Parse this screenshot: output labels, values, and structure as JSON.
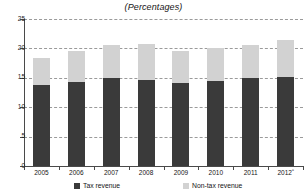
{
  "chart_data": {
    "type": "bar",
    "subtype": "stacked-bar",
    "title": "(Percentages)",
    "xlabel": "",
    "ylabel": "",
    "ylim": [
      0,
      25
    ],
    "yticks": [
      0,
      5,
      10,
      15,
      20,
      25
    ],
    "grid": true,
    "legend_position": "bottom",
    "categories": [
      "2005",
      "2006",
      "2007",
      "2008",
      "2009",
      "2010",
      "2011",
      "2012"
    ],
    "category_labels": [
      "2005",
      "2006",
      "2007",
      "2008",
      "2009",
      "2010",
      "2011",
      "2012ᵃ"
    ],
    "series": [
      {
        "name": "Tax revenue",
        "color": "#3a3a3a",
        "values": [
          13.7,
          14.3,
          14.9,
          14.7,
          14.1,
          14.5,
          14.9,
          15.2
        ]
      },
      {
        "name": "Non-tax revenue",
        "color": "#d2d2d2",
        "values": [
          4.7,
          5.2,
          5.6,
          6.0,
          5.4,
          5.6,
          5.6,
          6.2
        ]
      }
    ],
    "totals": [
      18.4,
      19.5,
      20.5,
      20.7,
      19.5,
      20.1,
      20.5,
      21.4
    ]
  },
  "axis": {
    "y_tick_labels": [
      "25",
      "20",
      "15",
      "10",
      "5",
      "0"
    ],
    "y_tick_values": [
      25,
      20,
      15,
      10,
      5,
      0
    ]
  },
  "legend": {
    "items": [
      {
        "label": "Tax revenue",
        "color": "#3a3a3a"
      },
      {
        "label": "Non-tax revenue",
        "color": "#d2d2d2"
      }
    ]
  },
  "colors": {
    "tax": "#3a3a3a",
    "nontax": "#d2d2d2",
    "grid": "#9a9a9a",
    "axis": "#4a4a4a",
    "background": "#ffffff"
  }
}
